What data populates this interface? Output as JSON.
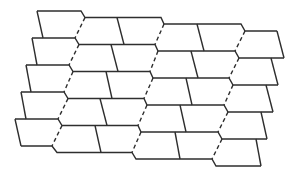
{
  "diagram": {
    "canvas": {
      "width": 296,
      "height": 172,
      "background": "#ffffff"
    },
    "stroke_color": "#2e2e2e",
    "rows": 5,
    "dashed_columns": 3,
    "horizontal_lines": [
      [
        [
          37,
          11
        ],
        [
          81,
          11
        ],
        [
          85,
          17.5
        ],
        [
          161,
          17.5
        ],
        [
          164,
          24
        ],
        [
          241,
          24
        ],
        [
          245,
          31
        ],
        [
          277,
          31
        ]
      ],
      [
        [
          32,
          38
        ],
        [
          75,
          38
        ],
        [
          79,
          44.5
        ],
        [
          155,
          44.5
        ],
        [
          158,
          51
        ],
        [
          235,
          51
        ],
        [
          239,
          58
        ],
        [
          284,
          58
        ]
      ],
      [
        [
          26,
          65
        ],
        [
          69,
          65
        ],
        [
          73,
          71.5
        ],
        [
          150,
          71.5
        ],
        [
          153,
          78
        ],
        [
          229,
          78
        ],
        [
          233,
          85
        ],
        [
          278,
          85
        ]
      ],
      [
        [
          21,
          92
        ],
        [
          64,
          92
        ],
        [
          68,
          98.5
        ],
        [
          144,
          98.5
        ],
        [
          147,
          105
        ],
        [
          224,
          105
        ],
        [
          228,
          112
        ],
        [
          273,
          112
        ]
      ],
      [
        [
          15,
          119
        ],
        [
          58,
          119
        ],
        [
          62,
          125.5
        ],
        [
          138,
          125.5
        ],
        [
          141,
          132
        ],
        [
          218,
          132
        ],
        [
          222,
          139
        ],
        [
          267,
          139
        ]
      ],
      [
        [
          21,
          146
        ],
        [
          52,
          146
        ],
        [
          57,
          152.5
        ],
        [
          132,
          152.5
        ],
        [
          136,
          159
        ],
        [
          212,
          159
        ],
        [
          216,
          166
        ],
        [
          261,
          166
        ]
      ]
    ],
    "left_edges": [
      [
        [
          37,
          11
        ],
        [
          43,
          38
        ]
      ],
      [
        [
          32,
          38
        ],
        [
          37,
          65
        ]
      ],
      [
        [
          26,
          65
        ],
        [
          31,
          92
        ]
      ],
      [
        [
          21,
          92
        ],
        [
          26,
          119
        ]
      ],
      [
        [
          15,
          119
        ],
        [
          21,
          146
        ]
      ]
    ],
    "right_edges": [
      [
        [
          277,
          31
        ],
        [
          284,
          58
        ]
      ],
      [
        [
          271,
          58
        ],
        [
          278,
          85
        ]
      ],
      [
        [
          266,
          85
        ],
        [
          273,
          112
        ]
      ],
      [
        [
          261,
          112
        ],
        [
          267,
          139
        ]
      ],
      [
        [
          256,
          139
        ],
        [
          261,
          166
        ]
      ]
    ],
    "dividers": [
      [
        [
          117,
          17.5
        ],
        [
          124,
          44.5
        ]
      ],
      [
        [
          197,
          24
        ],
        [
          204,
          51
        ]
      ],
      [
        [
          111,
          44.5
        ],
        [
          118,
          71.5
        ]
      ],
      [
        [
          191,
          51
        ],
        [
          198,
          78
        ]
      ],
      [
        [
          106,
          71.5
        ],
        [
          112,
          98.5
        ]
      ],
      [
        [
          186,
          78
        ],
        [
          192,
          105
        ]
      ],
      [
        [
          100,
          98.5
        ],
        [
          107,
          125.5
        ]
      ],
      [
        [
          180,
          105
        ],
        [
          186,
          132
        ]
      ],
      [
        [
          95,
          125.5
        ],
        [
          101,
          152.5
        ]
      ],
      [
        [
          175,
          132
        ],
        [
          180,
          159
        ]
      ]
    ],
    "dashed_seams": [
      [
        [
          85,
          17.5
        ],
        [
          75,
          38
        ]
      ],
      [
        [
          79,
          44.5
        ],
        [
          69,
          65
        ]
      ],
      [
        [
          73,
          71.5
        ],
        [
          64,
          92
        ]
      ],
      [
        [
          68,
          98.5
        ],
        [
          58,
          119
        ]
      ],
      [
        [
          62,
          125.5
        ],
        [
          52,
          146
        ]
      ],
      [
        [
          164,
          24
        ],
        [
          155,
          44.5
        ]
      ],
      [
        [
          158,
          51
        ],
        [
          150,
          71.5
        ]
      ],
      [
        [
          153,
          78
        ],
        [
          144,
          98.5
        ]
      ],
      [
        [
          147,
          105
        ],
        [
          138,
          125.5
        ]
      ],
      [
        [
          141,
          132
        ],
        [
          132,
          152.5
        ]
      ],
      [
        [
          245,
          31
        ],
        [
          235,
          51
        ]
      ],
      [
        [
          239,
          58
        ],
        [
          229,
          78
        ]
      ],
      [
        [
          233,
          85
        ],
        [
          224,
          105
        ]
      ],
      [
        [
          228,
          112
        ],
        [
          218,
          132
        ]
      ],
      [
        [
          222,
          139
        ],
        [
          212,
          159
        ]
      ]
    ]
  }
}
